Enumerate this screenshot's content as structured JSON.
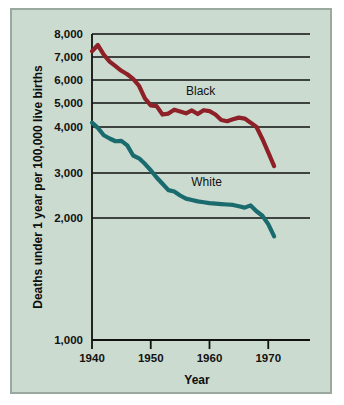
{
  "figure": {
    "background_color": "#ccdbcf",
    "border_color": "#9aa9a0",
    "page_background": "#ffffff"
  },
  "chart_data": {
    "type": "line",
    "title": "",
    "xlabel": "Year",
    "ylabel": "Deaths under 1 year per 100,000 live births",
    "xlim": [
      1940,
      1972
    ],
    "ylim": [
      1000,
      8000
    ],
    "grid": true,
    "grid_orientation": "horizontal",
    "legend_position": "inline-annotation",
    "y_axis_note": "irregular spacing: even steps from 8,000 to 2,000, then large gap to 1,000",
    "xticks": [
      1940,
      1950,
      1960,
      1970
    ],
    "xtick_labels": [
      "1940",
      "1950",
      "1960",
      "1970"
    ],
    "yticks": [
      8000,
      7000,
      6000,
      5000,
      4000,
      3000,
      2000,
      1000
    ],
    "ytick_labels": [
      "8,000",
      "7,000",
      "6,000",
      "5,000",
      "4,000",
      "3,000",
      "2,000",
      "1,000"
    ],
    "series": [
      {
        "name": "Black",
        "color": "#8e2028",
        "label_text": "Black",
        "label_x": 1958.5,
        "label_y": 5350,
        "x": [
          1940,
          1941,
          1942,
          1943,
          1944,
          1945,
          1946,
          1947,
          1948,
          1949,
          1950,
          1951,
          1952,
          1953,
          1954,
          1955,
          1956,
          1957,
          1958,
          1959,
          1960,
          1961,
          1962,
          1963,
          1964,
          1965,
          1966,
          1967,
          1968,
          1969,
          1970,
          1971
        ],
        "values": [
          7250,
          7520,
          7100,
          6800,
          6600,
          6400,
          6250,
          6050,
          5750,
          5200,
          4900,
          4870,
          4520,
          4560,
          4720,
          4650,
          4570,
          4690,
          4540,
          4700,
          4660,
          4520,
          4290,
          4240,
          4320,
          4390,
          4350,
          4180,
          4000,
          3740,
          3450,
          3150
        ]
      },
      {
        "name": "White",
        "color": "#1a6b6e",
        "label_text": "White",
        "label_x": 1959.5,
        "label_y": 2720,
        "x": [
          1940,
          1941,
          1942,
          1943,
          1944,
          1945,
          1946,
          1947,
          1948,
          1949,
          1950,
          1951,
          1952,
          1953,
          1954,
          1955,
          1956,
          1957,
          1958,
          1959,
          1960,
          1961,
          1962,
          1963,
          1964,
          1965,
          1966,
          1967,
          1968,
          1969,
          1970,
          1971
        ],
        "values": [
          4180,
          3980,
          3820,
          3750,
          3690,
          3700,
          3600,
          3380,
          3320,
          3200,
          3060,
          2900,
          2760,
          2620,
          2590,
          2500,
          2430,
          2400,
          2370,
          2350,
          2330,
          2320,
          2310,
          2300,
          2290,
          2260,
          2230,
          2280,
          2150,
          2050,
          1950,
          1850
        ]
      }
    ]
  },
  "annotations": {
    "xaxis_title": "Year",
    "yaxis_title": "Deaths under 1 year per 100,000 live births"
  }
}
